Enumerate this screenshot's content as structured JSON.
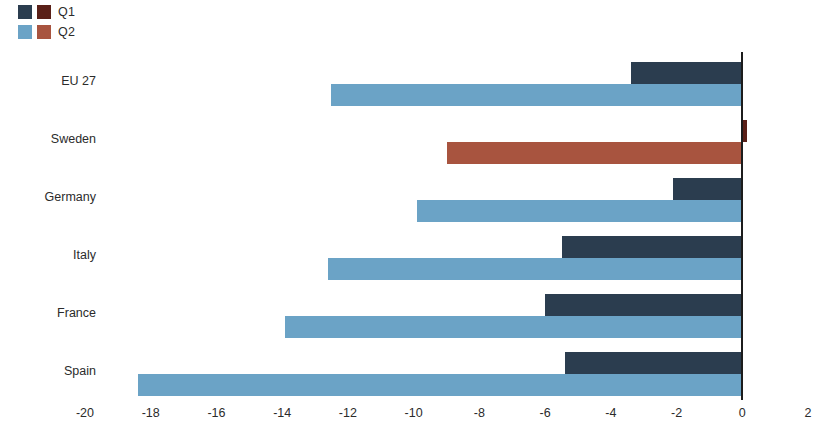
{
  "legend": {
    "position": "top-left",
    "rows": [
      {
        "label": "Q1",
        "swatches": [
          "#2b3d4f",
          "#5a2018"
        ]
      },
      {
        "label": "Q2",
        "swatches": [
          "#6ba3c6",
          "#a8543f"
        ]
      }
    ]
  },
  "chart_data": {
    "type": "bar",
    "orientation": "horizontal",
    "title": "",
    "xlabel": "",
    "ylabel": "",
    "xlim": [
      -20,
      2
    ],
    "xticks": [
      -20,
      -18,
      -16,
      -14,
      -12,
      -10,
      -8,
      -6,
      -4,
      -2,
      0,
      2
    ],
    "xtick_labels": [
      "-20",
      "-18",
      "-16",
      "-14",
      "-12",
      "-10",
      "-8",
      "-6",
      "-4",
      "-2",
      "0",
      "2"
    ],
    "grid": false,
    "zero_line": true,
    "categories": [
      "EU 27",
      "Sweden",
      "Germany",
      "Italy",
      "France",
      "Spain"
    ],
    "series": [
      {
        "name": "Q1",
        "color": "#2b3d4f",
        "highlight_color": "#5a2018",
        "values": [
          -3.4,
          0.15,
          -2.1,
          -5.5,
          -6.0,
          -5.4
        ]
      },
      {
        "name": "Q2",
        "color": "#6ba3c6",
        "highlight_color": "#a8543f",
        "values": [
          -12.5,
          -9.0,
          -9.9,
          -12.6,
          -13.9,
          -18.4
        ]
      }
    ],
    "highlighted_category": "Sweden"
  }
}
